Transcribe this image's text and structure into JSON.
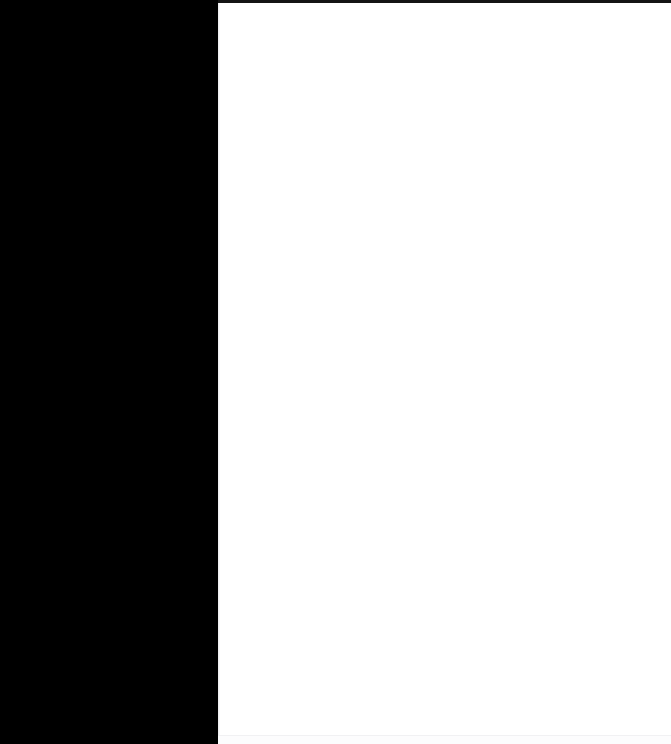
{
  "window": {
    "title": "",
    "width": 671,
    "height": 744
  },
  "colors": {
    "gutter_background": "#000000",
    "gutter_stripe": "#0a0a0a",
    "top_rule": "#141414",
    "content_background": "#ffffff",
    "content_edge": "#e9e9ec",
    "content_hairline": "#f1f1f3",
    "content_bottom_strip": "#fcfcfd"
  },
  "top_rule": {
    "label": ""
  },
  "left_panel": {
    "label": "",
    "items": []
  },
  "content_pane": {
    "label": "",
    "body_text": "",
    "bottom_rule_label": ""
  }
}
